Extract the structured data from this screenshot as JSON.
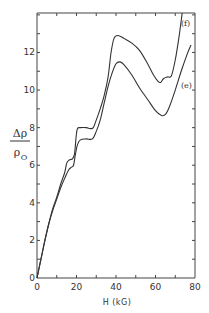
{
  "chart_data": {
    "type": "line",
    "title": "",
    "xlabel": "H (kG)",
    "ylabel_num": "Δρ",
    "ylabel_den": "ρ",
    "ylabel_den_sub": "O",
    "xlim": [
      0,
      80
    ],
    "ylim": [
      0,
      14.1
    ],
    "xticks": [
      0,
      20,
      40,
      60,
      80
    ],
    "xtick_labels": [
      "0",
      "20",
      "40",
      "60",
      "80"
    ],
    "x_minor_step": 10,
    "yticks": [
      0,
      2,
      4,
      6,
      8,
      10,
      12
    ],
    "ytick_labels": [
      "0",
      "2",
      "4",
      "6",
      "8",
      "10",
      "12"
    ],
    "y_minor_step": 1,
    "grid": false,
    "legend": "inline curve labels at right",
    "series": [
      {
        "name": "(f)",
        "label": "(f)",
        "points": [
          [
            0,
            0
          ],
          [
            2,
            1.0
          ],
          [
            4,
            2.0
          ],
          [
            6,
            2.9
          ],
          [
            8,
            3.7
          ],
          [
            10,
            4.3
          ],
          [
            12,
            5.0
          ],
          [
            14,
            5.6
          ],
          [
            15,
            6.1
          ],
          [
            16,
            6.25
          ],
          [
            17,
            6.3
          ],
          [
            18,
            6.35
          ],
          [
            19,
            6.6
          ],
          [
            19.8,
            7.5
          ],
          [
            20.5,
            7.95
          ],
          [
            22,
            8.0
          ],
          [
            25,
            8.0
          ],
          [
            27,
            7.95
          ],
          [
            28.5,
            8.0
          ],
          [
            30,
            8.4
          ],
          [
            32,
            9.0
          ],
          [
            34,
            9.7
          ],
          [
            36,
            10.7
          ],
          [
            37.5,
            12.0
          ],
          [
            39,
            12.75
          ],
          [
            41,
            12.9
          ],
          [
            44,
            12.75
          ],
          [
            48,
            12.5
          ],
          [
            52,
            12.1
          ],
          [
            56,
            11.4
          ],
          [
            59,
            10.8
          ],
          [
            61,
            10.5
          ],
          [
            62.5,
            10.4
          ],
          [
            64,
            10.6
          ],
          [
            66,
            10.7
          ],
          [
            68,
            10.75
          ],
          [
            70,
            11.6
          ],
          [
            72,
            12.9
          ],
          [
            73.5,
            14.1
          ]
        ]
      },
      {
        "name": "(e)",
        "label": "(e)",
        "points": [
          [
            0,
            0
          ],
          [
            2,
            1.0
          ],
          [
            4,
            2.0
          ],
          [
            6,
            2.9
          ],
          [
            8,
            3.6
          ],
          [
            10,
            4.2
          ],
          [
            12,
            4.8
          ],
          [
            14,
            5.3
          ],
          [
            16,
            5.75
          ],
          [
            17.5,
            5.9
          ],
          [
            18.5,
            6.0
          ],
          [
            19.5,
            6.6
          ],
          [
            20.5,
            7.1
          ],
          [
            22,
            7.35
          ],
          [
            25,
            7.4
          ],
          [
            28,
            7.4
          ],
          [
            30,
            7.8
          ],
          [
            32,
            8.4
          ],
          [
            34,
            9.3
          ],
          [
            36,
            10.2
          ],
          [
            38,
            10.9
          ],
          [
            40,
            11.4
          ],
          [
            42,
            11.5
          ],
          [
            44,
            11.35
          ],
          [
            48,
            10.8
          ],
          [
            52,
            10.1
          ],
          [
            56,
            9.5
          ],
          [
            60,
            8.9
          ],
          [
            63,
            8.65
          ],
          [
            65,
            8.7
          ],
          [
            67,
            9.1
          ],
          [
            70,
            10.0
          ],
          [
            73,
            11.0
          ],
          [
            76,
            11.9
          ],
          [
            78,
            12.4
          ]
        ]
      }
    ]
  }
}
